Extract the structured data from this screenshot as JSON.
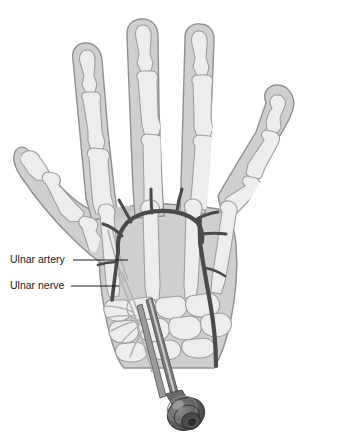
{
  "figure": {
    "width": 347,
    "height": 436
  },
  "labels": [
    {
      "id": "ulnar-artery",
      "text": "Ulnar artery",
      "text_x": 10,
      "text_y": 260,
      "leader": {
        "x1": 73,
        "y1": 260,
        "x2": 128,
        "y2": 260
      }
    },
    {
      "id": "ulnar-nerve",
      "text": "Ulnar nerve",
      "text_x": 10,
      "text_y": 286,
      "leader": {
        "x1": 71,
        "y1": 286,
        "x2": 119,
        "y2": 286
      }
    }
  ],
  "colors": {
    "background": "#ffffff",
    "soft_tissue_fill": "#c9c9c9",
    "soft_tissue_edge": "#8f8f8f",
    "bone_fill": "#ececec",
    "bone_edge": "#9e9e9e",
    "palm_fill": "#d4d4d4",
    "artery": "#4a4a4a",
    "nerve": "#b8b8b8",
    "catheter_shaft": "#6e6e6e",
    "catheter_hub": "#5a5a5a",
    "label_text": "#1a1a1a",
    "leader_line": "#1a1a1a"
  },
  "anatomy": {
    "digits": [
      {
        "name": "thumb",
        "label": "first digit",
        "phalanx_count": 2,
        "tip_x": 28,
        "tip_y": 150
      },
      {
        "name": "index-finger",
        "label": "second digit",
        "phalanx_count": 3,
        "tip_x": 84,
        "tip_y": 48
      },
      {
        "name": "middle-finger",
        "label": "third digit",
        "phalanx_count": 3,
        "tip_x": 139,
        "tip_y": 22
      },
      {
        "name": "ring-finger",
        "label": "fourth digit",
        "phalanx_count": 3,
        "tip_x": 197,
        "tip_y": 26
      },
      {
        "name": "little-finger",
        "label": "fifth digit",
        "phalanx_count": 3,
        "tip_x": 283,
        "tip_y": 88
      }
    ],
    "metacarpal_count": 5,
    "carpal_row_count": 2,
    "arterial_arch": {
      "name": "superficial palmar arch",
      "branch_count": 6
    },
    "nerve": {
      "name": "ulnar nerve",
      "branch_count": 5
    },
    "needle": {
      "name": "block needle with luer-lock hub",
      "entry_x": 148,
      "entry_y": 316,
      "hub_x": 186,
      "hub_y": 414
    }
  }
}
